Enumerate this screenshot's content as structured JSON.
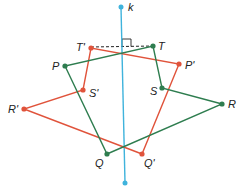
{
  "diagram": {
    "colors": {
      "line_k": "#3fb3dc",
      "original": "#2e7d4f",
      "image": "#e0533b",
      "dashed": "#222222"
    },
    "line_k": {
      "label": "k",
      "top": [
        121,
        7
      ],
      "bottom": [
        125,
        183
      ]
    },
    "original_polygon": {
      "name": "PQRST",
      "vertices": [
        {
          "label": "P",
          "x": 65,
          "y": 66
        },
        {
          "label": "Q",
          "x": 107,
          "y": 154
        },
        {
          "label": "R",
          "x": 222,
          "y": 104
        },
        {
          "label": "S",
          "x": 162,
          "y": 88
        },
        {
          "label": "T",
          "x": 153,
          "y": 46
        }
      ]
    },
    "image_polygon": {
      "name": "P'Q'R'S'T'",
      "vertices": [
        {
          "label": "P'",
          "x": 179,
          "y": 64
        },
        {
          "label": "Q'",
          "x": 142,
          "y": 154
        },
        {
          "label": "R'",
          "x": 24,
          "y": 109
        },
        {
          "label": "S'",
          "x": 83,
          "y": 90
        },
        {
          "label": "T'",
          "x": 91,
          "y": 48
        }
      ]
    },
    "dashed_segment": {
      "from": "T'",
      "to": "T",
      "right_angle_marker": true
    }
  }
}
